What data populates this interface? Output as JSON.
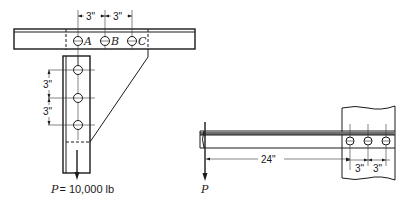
{
  "figure": {
    "left_view": {
      "bolt_labels": [
        "A",
        "B",
        "C"
      ],
      "horizontal_spacing_labels": [
        "3\"",
        "3\""
      ],
      "vertical_spacing_labels": [
        "3\"",
        "3\""
      ],
      "load_symbol": "P",
      "load_value": "= 10,000 lb"
    },
    "right_view": {
      "load_symbol": "P",
      "lever_arm_label": "24\"",
      "bolt_spacing_labels": [
        "3\"",
        "3\""
      ]
    }
  }
}
